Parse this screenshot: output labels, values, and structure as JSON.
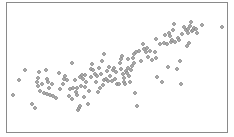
{
  "chart_data": {
    "type": "scatter",
    "title": "",
    "xlabel": "",
    "ylabel": "",
    "grid": false,
    "legend": null,
    "axes_visible": false,
    "frame": {
      "x": 6,
      "y": 2,
      "width": 222,
      "height": 131,
      "color": "#8a8a8a"
    },
    "marker": {
      "shape": "diamond",
      "size": 4,
      "fill": "#a8a8a8",
      "stroke": "#7a7a7a"
    },
    "coordinate_space": "pixel (x right, y down) within 234x137 image; no axis ticks shown",
    "points": [
      [
        13,
        95
      ],
      [
        19,
        80
      ],
      [
        25,
        70
      ],
      [
        32,
        104
      ],
      [
        35,
        108
      ],
      [
        37,
        82
      ],
      [
        38,
        78
      ],
      [
        38,
        86
      ],
      [
        39,
        72
      ],
      [
        40,
        91
      ],
      [
        42,
        84
      ],
      [
        44,
        93
      ],
      [
        46,
        70
      ],
      [
        47,
        79
      ],
      [
        47,
        94
      ],
      [
        48,
        82
      ],
      [
        49,
        88
      ],
      [
        50,
        95
      ],
      [
        52,
        84
      ],
      [
        53,
        96
      ],
      [
        56,
        98
      ],
      [
        59,
        73
      ],
      [
        60,
        89
      ],
      [
        63,
        84
      ],
      [
        64,
        79
      ],
      [
        65,
        76
      ],
      [
        67,
        80
      ],
      [
        69,
        96
      ],
      [
        70,
        89
      ],
      [
        72,
        63
      ],
      [
        72,
        99
      ],
      [
        73,
        88
      ],
      [
        75,
        80
      ],
      [
        76,
        92
      ],
      [
        77,
        88
      ],
      [
        77,
        95
      ],
      [
        78,
        110
      ],
      [
        79,
        108
      ],
      [
        80,
        106
      ],
      [
        80,
        77
      ],
      [
        81,
        86
      ],
      [
        82,
        75
      ],
      [
        83,
        79
      ],
      [
        84,
        97
      ],
      [
        85,
        87
      ],
      [
        85,
        75
      ],
      [
        86,
        82
      ],
      [
        88,
        104
      ],
      [
        89,
        91
      ],
      [
        91,
        69
      ],
      [
        91,
        77
      ],
      [
        92,
        64
      ],
      [
        93,
        70
      ],
      [
        95,
        74
      ],
      [
        96,
        82
      ],
      [
        97,
        76
      ],
      [
        98,
        92
      ],
      [
        99,
        68
      ],
      [
        100,
        88
      ],
      [
        101,
        74
      ],
      [
        102,
        61
      ],
      [
        103,
        85
      ],
      [
        104,
        54
      ],
      [
        104,
        80
      ],
      [
        106,
        79
      ],
      [
        107,
        71
      ],
      [
        108,
        81
      ],
      [
        109,
        67
      ],
      [
        110,
        76
      ],
      [
        112,
        81
      ],
      [
        113,
        70
      ],
      [
        114,
        68
      ],
      [
        115,
        79
      ],
      [
        116,
        72
      ],
      [
        117,
        84
      ],
      [
        119,
        84
      ],
      [
        120,
        63
      ],
      [
        121,
        59
      ],
      [
        121,
        69
      ],
      [
        122,
        56
      ],
      [
        123,
        74
      ],
      [
        124,
        82
      ],
      [
        124,
        78
      ],
      [
        125,
        84
      ],
      [
        126,
        71
      ],
      [
        127,
        73
      ],
      [
        128,
        68
      ],
      [
        128,
        59
      ],
      [
        129,
        76
      ],
      [
        130,
        82
      ],
      [
        131,
        70
      ],
      [
        132,
        66
      ],
      [
        133,
        58
      ],
      [
        134,
        63
      ],
      [
        134,
        54
      ],
      [
        135,
        93
      ],
      [
        136,
        52
      ],
      [
        137,
        106
      ],
      [
        139,
        51
      ],
      [
        141,
        61
      ],
      [
        143,
        44
      ],
      [
        144,
        49
      ],
      [
        146,
        52
      ],
      [
        147,
        48
      ],
      [
        148,
        57
      ],
      [
        150,
        51
      ],
      [
        152,
        60
      ],
      [
        155,
        52
      ],
      [
        156,
        58
      ],
      [
        156,
        39
      ],
      [
        157,
        77
      ],
      [
        160,
        44
      ],
      [
        162,
        82
      ],
      [
        164,
        43
      ],
      [
        165,
        35
      ],
      [
        167,
        44
      ],
      [
        168,
        67
      ],
      [
        169,
        33
      ],
      [
        170,
        36
      ],
      [
        171,
        42
      ],
      [
        172,
        40
      ],
      [
        173,
        30
      ],
      [
        174,
        24
      ],
      [
        175,
        42
      ],
      [
        177,
        69
      ],
      [
        178,
        38
      ],
      [
        179,
        40
      ],
      [
        180,
        61
      ],
      [
        181,
        84
      ],
      [
        182,
        34
      ],
      [
        184,
        27
      ],
      [
        186,
        30
      ],
      [
        187,
        46
      ],
      [
        188,
        29
      ],
      [
        188,
        33
      ],
      [
        189,
        43
      ],
      [
        190,
        26
      ],
      [
        191,
        22
      ],
      [
        192,
        31
      ],
      [
        193,
        30
      ],
      [
        194,
        28
      ],
      [
        196,
        29
      ],
      [
        197,
        33
      ],
      [
        202,
        25
      ],
      [
        222,
        27
      ]
    ]
  }
}
